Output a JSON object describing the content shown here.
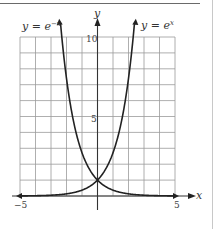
{
  "chart_data": {
    "type": "line",
    "title": "",
    "xlabel": "x",
    "ylabel": "y",
    "xlim": [
      -5,
      5
    ],
    "ylim": [
      0,
      10
    ],
    "grid": true,
    "x_ticks": [
      -5,
      5
    ],
    "y_ticks": [
      5,
      10
    ],
    "x_tick_labels": [
      "−5",
      "5"
    ],
    "y_tick_labels": [
      "5",
      "10"
    ],
    "series": [
      {
        "name": "y = e^{-x}",
        "label": "y = e⁻ˣ",
        "color": "#222222",
        "x": [
          -2.3,
          -2,
          -1.5,
          -1,
          -0.5,
          0,
          0.5,
          1,
          2,
          3,
          4,
          5
        ],
        "y": [
          9.97,
          7.39,
          4.48,
          2.72,
          1.65,
          1.0,
          0.61,
          0.37,
          0.14,
          0.05,
          0.02,
          0.007
        ]
      },
      {
        "name": "y = e^{x}",
        "label": "y = eˣ",
        "color": "#222222",
        "x": [
          -5,
          -4,
          -3,
          -2,
          -1,
          -0.5,
          0,
          0.5,
          1,
          1.5,
          2,
          2.3
        ],
        "y": [
          0.007,
          0.02,
          0.05,
          0.14,
          0.37,
          0.61,
          1.0,
          1.65,
          2.72,
          4.48,
          7.39,
          9.97
        ]
      }
    ],
    "annotations": [
      "y = e⁻ˣ",
      "y = eˣ"
    ],
    "legend": "none (curves labeled inline at top)"
  },
  "labels": {
    "left_curve": "y = e",
    "left_curve_exp": "−x",
    "right_curve": "y = e",
    "right_curve_exp": "x",
    "x_axis": "x",
    "y_axis": "y",
    "tick_x_neg5": "−5",
    "tick_x_5": "5",
    "tick_y_5": "5",
    "tick_y_10": "10"
  }
}
